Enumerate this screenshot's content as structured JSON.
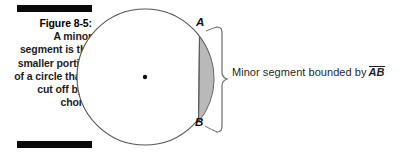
{
  "figure": {
    "caption_title": "Figure 8-5:",
    "caption_body": "A minor segment is the smaller portion of a circle that's cut off by a chord.",
    "rule_color": "#0a0a0a"
  },
  "diagram": {
    "type": "circle-with-minor-segment",
    "circle": {
      "center_x": 145,
      "center_y": 77,
      "radius": 68,
      "stroke": "#555555",
      "fill": "#ffffff"
    },
    "center_dot": {
      "x": 145,
      "y": 77,
      "radius": 2.2,
      "color": "#111111"
    },
    "chord": {
      "from_point": "A",
      "to_point": "B",
      "ax": 199.5,
      "ay": 36.5,
      "bx": 198.5,
      "by": 122.0,
      "stroke": "#555555"
    },
    "segment_shading": {
      "fill": "#b9b9b9",
      "stroke": "#6a6a6a",
      "opacity": 1
    },
    "point_labels": [
      {
        "name": "A",
        "text": "A"
      },
      {
        "name": "B",
        "text": "B"
      }
    ],
    "brace": {
      "top_y": 27,
      "bottom_y": 132,
      "x": 214,
      "stroke": "#6b6b6b"
    },
    "annotation": {
      "prefix": "Minor segment bounded by",
      "segment_notation": "AB",
      "notation_style": "overline"
    }
  },
  "colors": {
    "ink": "#1a1a1a",
    "line": "#555555",
    "shade": "#b9b9b9",
    "background": "#ffffff"
  }
}
